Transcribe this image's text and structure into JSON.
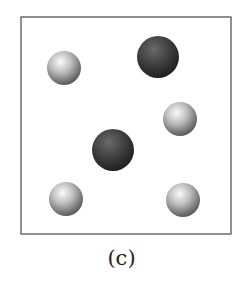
{
  "figure": {
    "caption": "(c)",
    "box": {
      "x": 21,
      "y": 17,
      "width": 210,
      "height": 217,
      "stroke": "#555555"
    },
    "colors": {
      "light_sphere": "#c8c8c8",
      "dark_sphere": "#3c3c3c"
    },
    "particles": [
      {
        "type": "light",
        "cx": 64,
        "cy": 68,
        "r": 17
      },
      {
        "type": "dark",
        "cx": 158,
        "cy": 57,
        "r": 21
      },
      {
        "type": "light",
        "cx": 180,
        "cy": 119,
        "r": 17
      },
      {
        "type": "dark",
        "cx": 113,
        "cy": 150,
        "r": 21
      },
      {
        "type": "light",
        "cx": 66,
        "cy": 199,
        "r": 17
      },
      {
        "type": "light",
        "cx": 183,
        "cy": 200,
        "r": 17
      }
    ]
  }
}
